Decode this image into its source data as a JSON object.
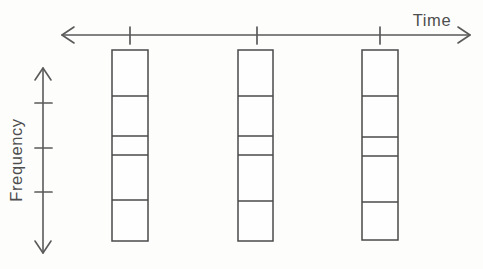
{
  "figure": {
    "kind": "time-frequency-diagram",
    "background_color": "#fdfdfc",
    "line_color": "#4a4a4a",
    "axis_color": "#5a5a5a",
    "axes": {
      "horizontal": {
        "label": "Time",
        "label_x": 432,
        "label_y": 26,
        "arrow_style": "double-headed",
        "y": 35,
        "x_start": 62,
        "x_end": 470,
        "ticks": [
          {
            "x": 130,
            "y_top": 27,
            "y_bottom": 44
          },
          {
            "x": 257,
            "y_top": 27,
            "y_bottom": 44
          },
          {
            "x": 380,
            "y_top": 27,
            "y_bottom": 44
          }
        ]
      },
      "vertical": {
        "label": "Frequency",
        "label_x": 22,
        "label_y": 160,
        "rotation_deg": -90,
        "arrow_style": "double-headed",
        "x": 43,
        "y_start": 68,
        "y_end": 253,
        "ticks": [
          {
            "y": 103,
            "x_left": 35,
            "x_right": 52
          },
          {
            "y": 148,
            "x_left": 35,
            "x_right": 52
          },
          {
            "y": 192,
            "x_left": 35,
            "x_right": 52
          }
        ]
      }
    },
    "columns": [
      {
        "name": "column-1",
        "x": 112,
        "width": 36,
        "y_top": 50,
        "y_bottom": 241,
        "dividers": [
          96,
          136,
          155,
          200
        ],
        "segment_count": 5
      },
      {
        "name": "column-2",
        "x": 238,
        "width": 35,
        "y_top": 50,
        "y_bottom": 241,
        "dividers": [
          96,
          136,
          155,
          201
        ],
        "segment_count": 5
      },
      {
        "name": "column-3",
        "x": 362,
        "width": 36,
        "y_top": 50,
        "y_bottom": 240,
        "dividers": [
          96,
          137,
          156,
          202
        ],
        "segment_count": 5
      }
    ]
  }
}
